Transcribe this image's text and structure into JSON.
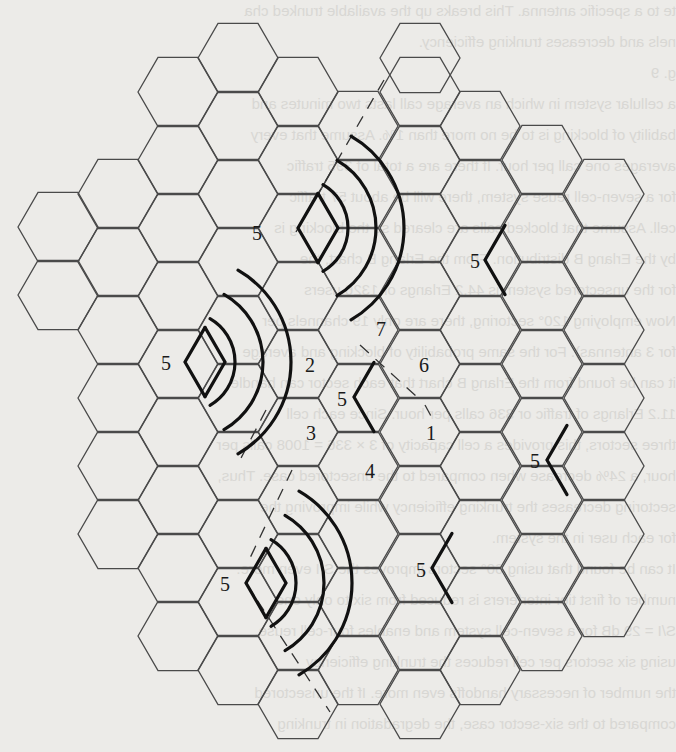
{
  "figure": {
    "hex_radius": 40,
    "columns": [
      {
        "cx": 58,
        "cy": [
          227,
          295
        ]
      },
      {
        "cx": 118,
        "cy": [
          194,
          262,
          330,
          398,
          466,
          534
        ]
      },
      {
        "cx": 178,
        "cy": [
          92,
          160,
          228,
          296,
          364,
          432,
          500,
          568,
          636
        ]
      },
      {
        "cx": 238,
        "cy": [
          58,
          126,
          194,
          262,
          330,
          398,
          466,
          534,
          602,
          670
        ]
      },
      {
        "cx": 298,
        "cy": [
          92,
          160,
          228,
          296,
          364,
          432,
          500,
          568,
          636,
          704
        ]
      },
      {
        "cx": 358,
        "cy": [
          126,
          194,
          262,
          330,
          398,
          466,
          534,
          602,
          670
        ]
      },
      {
        "cx": 420,
        "cy": [
          58,
          92,
          160,
          228,
          296,
          364,
          432,
          500,
          568,
          636,
          704
        ]
      },
      {
        "cx": 480,
        "cy": [
          126,
          194,
          262,
          330,
          398,
          466,
          534,
          602,
          670
        ]
      },
      {
        "cx": 542,
        "cy": [
          160,
          228,
          296,
          364,
          432,
          500,
          568,
          636
        ]
      },
      {
        "cx": 604,
        "cy": [
          194,
          262,
          330,
          398,
          466,
          534,
          602
        ]
      }
    ],
    "cluster_labels": [
      {
        "text": "7",
        "x": 376,
        "y": 336
      },
      {
        "text": "6",
        "x": 419,
        "y": 372
      },
      {
        "text": "1",
        "x": 426,
        "y": 440
      },
      {
        "text": "4",
        "x": 365,
        "y": 478
      },
      {
        "text": "3",
        "x": 306,
        "y": 440
      },
      {
        "text": "2",
        "x": 305,
        "y": 372
      },
      {
        "text": "5",
        "x": 337,
        "y": 406
      }
    ],
    "cochannel_cells": [
      {
        "label": "5",
        "lx": 252,
        "ly": 240,
        "apex_x": 298,
        "apex_y": 228,
        "radiating": true
      },
      {
        "label": "5",
        "lx": 161,
        "ly": 370,
        "apex_x": 185,
        "apex_y": 362,
        "radiating": true
      },
      {
        "label": "5",
        "lx": 220,
        "ly": 591,
        "apex_x": 246,
        "apex_y": 583,
        "radiating": true
      },
      {
        "label": "5",
        "lx": 470,
        "ly": 268,
        "apex_x": 485,
        "apex_y": 260,
        "radiating": false
      },
      {
        "label": "5",
        "lx": 530,
        "ly": 468,
        "apex_x": 547,
        "apex_y": 460,
        "radiating": false
      },
      {
        "label": "5",
        "lx": 416,
        "ly": 577,
        "apex_x": 432,
        "apex_y": 568,
        "radiating": false
      },
      {
        "label": "5",
        "lx": 337,
        "ly": 406,
        "apex_x": 354,
        "apex_y": 397,
        "radiating": false,
        "center": true
      }
    ],
    "arc_sets": [
      {
        "cx": 298,
        "cy": 228,
        "radii": [
          50,
          78,
          106
        ],
        "start": -60,
        "end": 60
      },
      {
        "cx": 185,
        "cy": 362,
        "radii": [
          50,
          78,
          106
        ],
        "start": -60,
        "end": 60
      },
      {
        "cx": 246,
        "cy": 583,
        "radii": [
          50,
          78,
          106
        ],
        "start": -60,
        "end": 60
      }
    ],
    "dashed_lines": [
      {
        "x1": 384,
        "y1": 80,
        "x2": 296,
        "y2": 232
      },
      {
        "x1": 360,
        "y1": 345,
        "x2": 416,
        "y2": 396
      },
      {
        "x1": 425,
        "y1": 405,
        "x2": 432,
        "y2": 418
      },
      {
        "x1": 266,
        "y1": 410,
        "x2": 240,
        "y2": 460
      },
      {
        "x1": 246,
        "y1": 583,
        "x2": 330,
        "y2": 712
      },
      {
        "x1": 292,
        "y1": 470,
        "x2": 250,
        "y2": 558
      }
    ]
  },
  "bleed_text": [
    "te to a specific antenna. This breaks up the available trunked cha",
    "nels and decreases trunking efficiency.",
    "g. 9",
    "a cellular system in which an average call lasts two minutes and",
    "bability of blocking is to be no more than 1%. Assume that every",
    "averages one call per hour. If there are a total of 395 traffic",
    "for a seven-cell reuse system, there will be about 57 traffic",
    "cell. Assume that blocked calls are cleared so the blocking is",
    "by the Erlang B distribution. From the Erlang B chart, the",
    "for the unsectored system is 44.2 Erlangs or 1326 users",
    "Now employing 120° sectoring, there are only 19 channels per",
    "for 3 antennas). For the same probability of blocking and average",
    "it can be found from the Erlang B chart that each sector can handle",
    "11.2 Erlangs of traffic or 336 calls per hour. Since each cell",
    "three sectors, this provides a cell capacity of 3 × 336 = 1008 calls per",
    "hour, a 24% decrease when compared to the unsectored case. Thus,",
    "sectoring decreases the trunking efficiency while improving the",
    "for each user in the system.",
    "It can be found that using 60° sectors improves the S/I even more.",
    "number of first tier interferers is reduced from six to only one.",
    "S/I = 29 dB for a seven-cell system and enables four-cell reuse.",
    "using six sectors per cell reduces the trunking efficiency",
    "the number of necessary handoffs even more. If the unsectored",
    "compared to the six-sector case, the degradation in trunking"
  ]
}
